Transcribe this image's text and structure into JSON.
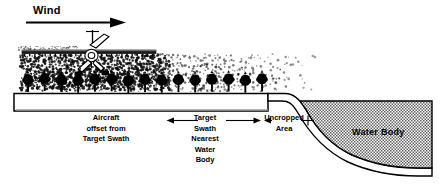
{
  "figure": {
    "title_label": "Wind",
    "labels": {
      "wind": "Wind",
      "aircraft_offset": [
        "Aircraft",
        "offset from",
        "Target Swath"
      ],
      "target_swath": [
        "Target",
        "Swath",
        "Nearest",
        "Water",
        "Body"
      ],
      "uncropped_area": [
        "Uncropped",
        "Area"
      ],
      "water_body": "Water Body"
    },
    "colors": {
      "ink": "#000000",
      "water_fill": "#9a9a9a",
      "drift_dots": "#1a1a1a",
      "paper": "#ffffff"
    },
    "elements": {
      "wind_arrow": "wind-direction-arrow",
      "aircraft": "aircraft-silhouette",
      "spray_boom": "spray-boom-bar",
      "spray_drift": "spray-drift-cloud",
      "crop_row": "tree-crop-row",
      "field_block": "field-ground-block",
      "bank_slope": "embankment-slope",
      "water_body": "water-body-region",
      "target_swath_arrow": "target-swath-extent-arrow",
      "uncropped_arrow": "uncropped-area-extent-arrow"
    },
    "counts": {
      "trees": 15,
      "boom_nozzles": 26
    }
  }
}
